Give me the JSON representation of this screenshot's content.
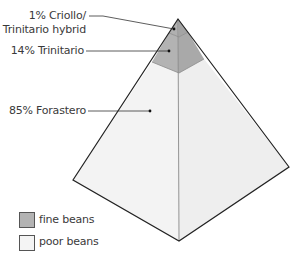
{
  "diagram": {
    "type": "pyramid",
    "segments": [
      {
        "label_line1": "1% Criollo/",
        "label_line2": "Trinitario hybrid",
        "percent": 1,
        "category": "fine beans"
      },
      {
        "label": "14% Trinitario",
        "percent": 14,
        "category": "fine beans"
      },
      {
        "label": "85% Forastero",
        "percent": 85,
        "category": "poor beans"
      }
    ],
    "legend": [
      {
        "label": "fine beans",
        "color": "#b3b3b3"
      },
      {
        "label": "poor beans",
        "color": "#f2f2f2"
      }
    ],
    "colors": {
      "fine": "#b3b3b3",
      "fine_dark": "#a6a6a6",
      "poor": "#f3f3f3",
      "poor_dark": "#ececec",
      "line": "#222222"
    }
  }
}
